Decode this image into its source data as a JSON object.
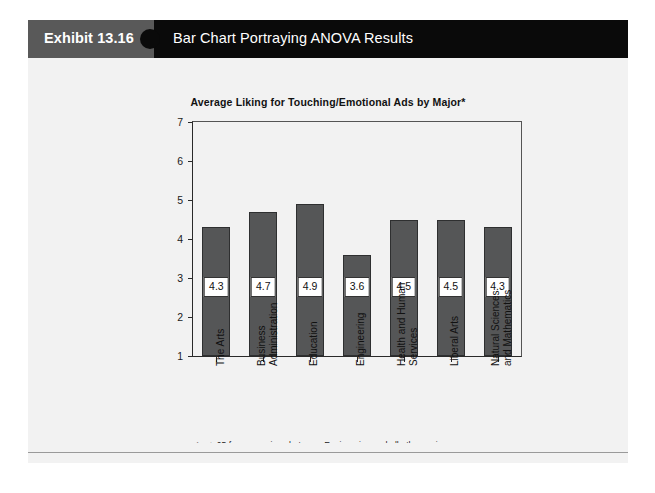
{
  "header": {
    "exhibit_number": "Exhibit 13.16",
    "exhibit_title": "Bar Chart Portraying ANOVA Results",
    "tab_color": "#595959",
    "bar_color": "#0a0a0a",
    "text_color": "#ffffff"
  },
  "panel": {
    "background": "#f2f2f2"
  },
  "footnote": "*p < .05 for comparison between Engineering and all other majors.",
  "chart_data": {
    "type": "bar",
    "title": "Average Liking for Touching/Emotional Ads by Major*",
    "xlabel": "",
    "ylabel": "",
    "ylim": [
      1,
      7
    ],
    "yticks": [
      1,
      2,
      3,
      4,
      5,
      6,
      7
    ],
    "ytick_labels": [
      "1",
      "2",
      "3",
      "4",
      "5",
      "6",
      "7"
    ],
    "grid": false,
    "legend": false,
    "bar_color": "#555657",
    "bar_edge_color": "#2e2f30",
    "value_label_box": true,
    "categories": [
      "The Arts",
      "Business Administration",
      "Education",
      "Engineering",
      "Health and Human Services",
      "Liberal Arts",
      "Natural Sciences and Mathematics"
    ],
    "category_lines": [
      [
        "The Arts"
      ],
      [
        "Business",
        "Administration"
      ],
      [
        "Education"
      ],
      [
        "Engineering"
      ],
      [
        "Health and Human",
        "Services"
      ],
      [
        "Liberal Arts"
      ],
      [
        "Natural Sciences",
        "and Mathematics"
      ]
    ],
    "values": [
      4.3,
      4.7,
      4.9,
      3.6,
      4.5,
      4.5,
      4.3
    ],
    "value_labels": [
      "4.3",
      "4.7",
      "4.9",
      "3.6",
      "4.5",
      "4.5",
      "4.3"
    ]
  }
}
